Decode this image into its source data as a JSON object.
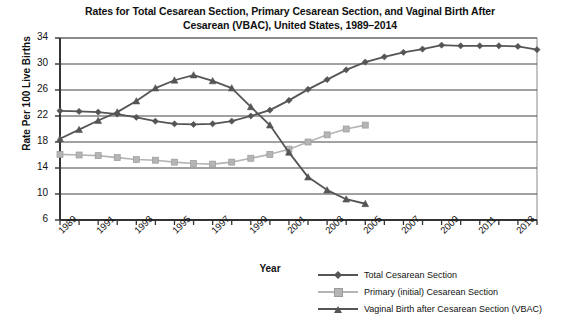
{
  "chart_data": {
    "type": "line",
    "title": "Rates for Total Cesarean Section, Primary Cesarean Section, and Vaginal Birth After Cesarean (VBAC), United States, 1989–2014",
    "title_line1": "Rates for Total Cesarean Section, Primary Cesarean Section, and Vaginal Birth After",
    "title_line2": "Cesarean (VBAC), United States, 1989–2014",
    "xlabel": "Year",
    "ylabel": "Rate Per 100 Live Births",
    "ylim": [
      6,
      34
    ],
    "ytick_values": [
      6,
      10,
      14,
      18,
      22,
      26,
      30,
      34
    ],
    "ytick_labels": [
      "6",
      "10",
      "14",
      "18",
      "22",
      "26",
      "30",
      "34"
    ],
    "xlim": [
      1989,
      2014
    ],
    "x": [
      1989,
      1990,
      1991,
      1992,
      1993,
      1994,
      1995,
      1996,
      1997,
      1998,
      1999,
      2000,
      2001,
      2002,
      2003,
      2004,
      2005,
      2006,
      2007,
      2008,
      2009,
      2010,
      2011,
      2012,
      2013,
      2014
    ],
    "xtick_values": [
      1989,
      1991,
      1993,
      1995,
      1997,
      1999,
      2001,
      2003,
      2005,
      2007,
      2009,
      2011,
      2013
    ],
    "xtick_labels": [
      "1989",
      "1991",
      "1993",
      "1995",
      "1997",
      "1999",
      "2001",
      "2003",
      "2005",
      "2007",
      "2009",
      "2011",
      "2013"
    ],
    "grid": "horizontal",
    "legend_position": "bottom-right",
    "series": [
      {
        "name": "Total Cesarean Section",
        "color": "#555555",
        "marker": "diamond",
        "values": [
          22.8,
          22.7,
          22.6,
          22.3,
          21.8,
          21.2,
          20.8,
          20.7,
          20.8,
          21.2,
          22.0,
          22.9,
          24.4,
          26.1,
          27.6,
          29.1,
          30.3,
          31.1,
          31.8,
          32.3,
          32.9,
          32.8,
          32.8,
          32.8,
          32.7,
          32.2
        ]
      },
      {
        "name": "Primary (initial) Cesarean Section",
        "color": "#b5b5b5",
        "marker": "square",
        "values": [
          16.1,
          16.0,
          15.9,
          15.6,
          15.3,
          15.2,
          14.9,
          14.7,
          14.6,
          14.9,
          15.5,
          16.1,
          16.9,
          18.0,
          19.1,
          20.0,
          20.6,
          null,
          null,
          null,
          null,
          null,
          null,
          null,
          null,
          null
        ]
      },
      {
        "name": "Vaginal Birth after Cesarean Section (VBAC)",
        "color": "#555555",
        "marker": "triangle",
        "values": [
          18.5,
          19.9,
          21.3,
          22.6,
          24.3,
          26.3,
          27.5,
          28.3,
          27.4,
          26.3,
          23.4,
          20.6,
          16.4,
          12.6,
          10.6,
          9.2,
          8.5,
          null,
          null,
          null,
          null,
          null,
          null,
          null,
          null,
          null
        ]
      }
    ],
    "legend_entries": [
      {
        "label": "Total Cesarean Section",
        "color": "#555555",
        "marker": "diamond"
      },
      {
        "label": "Primary (initial) Cesarean Section",
        "color": "#b5b5b5",
        "marker": "square"
      },
      {
        "label": "Vaginal Birth after Cesarean Section (VBAC)",
        "color": "#555555",
        "marker": "triangle"
      }
    ]
  }
}
